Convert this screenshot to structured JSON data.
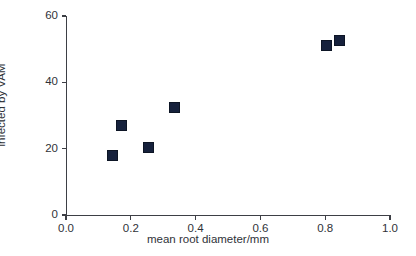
{
  "chart_data": {
    "type": "scatter",
    "title": "",
    "xlabel": "mean root diameter/mm",
    "ylabel": "% root length infected by VAM",
    "ylabel_lines": [
      "% root length",
      "infected by VAM"
    ],
    "xlim": [
      0.0,
      1.0
    ],
    "ylim": [
      0,
      60
    ],
    "grid": false,
    "legend": null,
    "marker_style": "filled-square",
    "marker_color": "#16213c",
    "axis_color": "#3d3f45",
    "background_color": "#ffffff",
    "xticks": [
      0.0,
      0.2,
      0.4,
      0.6,
      0.8,
      1.0
    ],
    "xtick_labels": [
      "0.0",
      "0.2",
      "0.4",
      "0.6",
      "0.8",
      "1.0"
    ],
    "yticks": [
      0,
      20,
      40,
      60
    ],
    "ytick_labels": [
      "0",
      "20",
      "40",
      "60"
    ],
    "series": [
      {
        "name": "root samples",
        "points": [
          {
            "x": 0.145,
            "y": 18.0
          },
          {
            "x": 0.17,
            "y": 27.0
          },
          {
            "x": 0.256,
            "y": 20.5
          },
          {
            "x": 0.335,
            "y": 32.5
          },
          {
            "x": 0.805,
            "y": 51.0
          },
          {
            "x": 0.843,
            "y": 52.5
          }
        ]
      }
    ]
  }
}
